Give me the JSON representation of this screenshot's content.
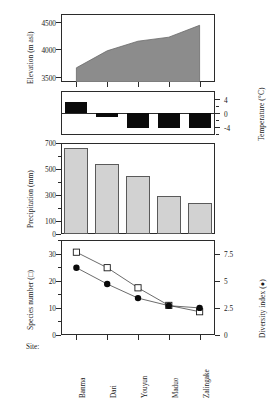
{
  "chart_data": {
    "type": "line",
    "title": "",
    "categories": [
      "Banma",
      "Dari",
      "Youyun",
      "Maduo",
      "Zalingake"
    ],
    "xlabel": "Site:",
    "panels": [
      {
        "type": "area",
        "ylabel": "Elevation (m asl)",
        "ylim": [
          3500,
          4700
        ],
        "yticks": [
          3500,
          4000,
          4500
        ],
        "ytick_labels": [
          "3500",
          "4000",
          "4500"
        ],
        "values": [
          3750,
          4050,
          4220,
          4290,
          4500
        ],
        "fill_color": "#8c8c8c"
      },
      {
        "type": "bar",
        "ylabel": "Temperature (°C)",
        "ylim": [
          -6,
          6
        ],
        "yticks": [
          4,
          0,
          -4
        ],
        "ytick_labels": [
          "4",
          "0",
          "-4"
        ],
        "values": [
          3.0,
          -1.0,
          -4.0,
          -4.0,
          -4.2
        ],
        "bar_color": "#0a0a0a",
        "axis_side": "right"
      },
      {
        "type": "bar",
        "ylabel": "Precipitation (mm)",
        "ylim": [
          0,
          700
        ],
        "yticks": [
          0,
          100,
          300,
          500,
          700
        ],
        "ytick_labels": [
          "0",
          "100",
          "300",
          "500",
          "700"
        ],
        "values": [
          660,
          540,
          450,
          292,
          240
        ],
        "bar_color": "#d2d2d2"
      },
      {
        "type": "line",
        "ylabel_left": "Species number (□)",
        "ylabel_right": "Diversity index (●)",
        "ylim_left": [
          0,
          35
        ],
        "yticks_left": [
          0,
          10,
          20,
          30
        ],
        "ytick_labels_left": [
          "0",
          "10",
          "20",
          "30"
        ],
        "ylim_right": [
          0,
          8.75
        ],
        "yticks_right": [
          0,
          2.5,
          5,
          7.5
        ],
        "ytick_labels_right": [
          "0",
          "2.5",
          "5",
          "7.5"
        ],
        "series": [
          {
            "name": "Species number",
            "marker": "open-square",
            "values": [
              30.5,
              24.8,
              17.4,
              10.9,
              8.6
            ]
          },
          {
            "name": "Diversity index",
            "marker": "filled-circle",
            "values": [
              6.2,
              4.7,
              3.4,
              2.7,
              2.5
            ]
          }
        ]
      }
    ]
  }
}
